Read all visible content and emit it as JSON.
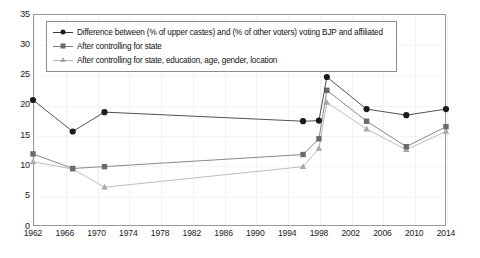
{
  "chart_data": {
    "type": "line",
    "title": "",
    "subtitle": "",
    "xlabel": "",
    "ylabel": "",
    "xlim": [
      1962,
      2014
    ],
    "ylim": [
      0,
      35
    ],
    "yticks": [
      0,
      5,
      10,
      15,
      20,
      25,
      30,
      35
    ],
    "xticks": [
      1962,
      1966,
      1970,
      1974,
      1978,
      1982,
      1986,
      1990,
      1994,
      1998,
      2002,
      2006,
      2010,
      2014
    ],
    "grid": true,
    "grid_axis": "both",
    "legend_position": "top-left-inside",
    "x": [
      1962,
      1967,
      1971,
      1996,
      1998,
      1999,
      2004,
      2009,
      2014
    ],
    "series": [
      {
        "name": "Difference between (% of upper castes) and (% of other voters) voting BJP and affiliated",
        "marker": "circle",
        "color": "#1c1c1c",
        "line_color": "#3d3d3d",
        "values": [
          20.8,
          15.6,
          18.8,
          17.3,
          17.4,
          24.6,
          19.3,
          18.3,
          19.3
        ]
      },
      {
        "name": "After controlling for state",
        "marker": "square",
        "color": "#6b6b6b",
        "line_color": "#7a7a7a",
        "values": [
          11.9,
          9.5,
          9.8,
          11.8,
          14.4,
          22.4,
          17.3,
          13.1,
          16.4
        ]
      },
      {
        "name": "After controlling for state, education, age, gender, location",
        "marker": "triangle",
        "color": "#a9a9a9",
        "line_color": "#b4b4b4",
        "values": [
          10.6,
          9.4,
          6.4,
          9.8,
          12.8,
          20.4,
          16.0,
          12.6,
          15.6
        ]
      }
    ]
  },
  "legend": {
    "items": [
      {
        "label": "Difference between (% of upper castes) and (% of other voters) voting BJP and affiliated",
        "marker": "circle-marker-icon"
      },
      {
        "label": "After controlling for state",
        "marker": "square-marker-icon"
      },
      {
        "label": "After controlling for state, education, age, gender, location",
        "marker": "triangle-marker-icon"
      }
    ]
  },
  "axes": {
    "y_tick_labels": [
      "35",
      "30",
      "25",
      "20",
      "15",
      "10",
      "5",
      "0"
    ],
    "x_tick_labels": [
      "1962",
      "1966",
      "1970",
      "1974",
      "1978",
      "1982",
      "1986",
      "1990",
      "1994",
      "1998",
      "2002",
      "2006",
      "2010",
      "2014"
    ]
  }
}
